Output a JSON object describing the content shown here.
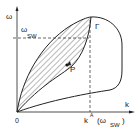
{
  "diagram": {
    "axes": {
      "y_label": "ω",
      "x_label": "k",
      "origin_label": "0"
    },
    "annotations": {
      "omega_sw_main": "ω",
      "omega_sw_sub": "SW",
      "gamma_label": "Γ",
      "point_label": "P",
      "kA_main": "k",
      "kA_sup": "A",
      "paren_open": "(ω",
      "paren_sub": "SW",
      "paren_close": ")"
    },
    "colors": {
      "line": "#222222",
      "background": "#ffffff"
    }
  }
}
